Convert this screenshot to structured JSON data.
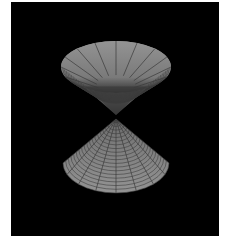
{
  "scene": {
    "description": "3D rendered double cone surface (two nappes meeting at apex) on black background",
    "background_color": "#000000",
    "border_color": "#ffffff",
    "surface_color": "#8a8a8a",
    "mesh_line_color": "#3a3a3a",
    "upper_cone": {
      "rim_center_x": 116,
      "rim_center_y": 67,
      "rim_rx": 55,
      "rim_ry": 26,
      "apex_x": 116,
      "apex_y": 115,
      "radial_lines": 16,
      "rings": 20
    },
    "lower_cone": {
      "rim_center_x": 116,
      "rim_center_y": 163,
      "rim_rx": 53,
      "rim_ry": 30,
      "apex_x": 116,
      "apex_y": 119,
      "radial_lines": 16,
      "rings": 20
    }
  }
}
